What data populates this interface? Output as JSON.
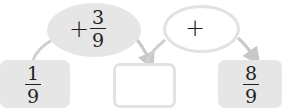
{
  "diagram": {
    "start": {
      "numerator": "1",
      "denominator": "9"
    },
    "step1": {
      "operator": "+",
      "numerator": "3",
      "denominator": "9"
    },
    "middle": {
      "value": ""
    },
    "step2": {
      "operator": "+",
      "value": ""
    },
    "end": {
      "numerator": "8",
      "denominator": "9"
    }
  },
  "colors": {
    "fill": "#e6e6e6",
    "border": "#e2e2e2",
    "arrow": "#c8c8c8",
    "text": "#222222"
  }
}
